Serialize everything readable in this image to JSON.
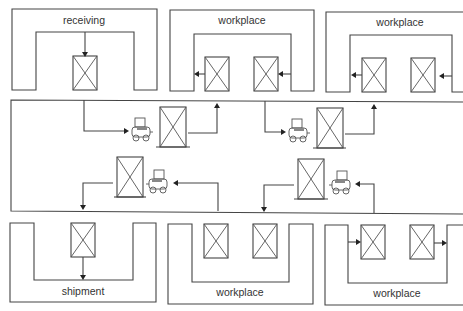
{
  "diagram": {
    "type": "warehouse material-flow layout",
    "zones": {
      "top": [
        {
          "id": "receiving",
          "label": "receiving",
          "pallets": 1
        },
        {
          "id": "workplace-top-1",
          "label": "workplace",
          "pallets": 2
        },
        {
          "id": "workplace-top-2",
          "label": "workplace",
          "pallets": 2
        }
      ],
      "bottom": [
        {
          "id": "shipment",
          "label": "shipment",
          "pallets": 1
        },
        {
          "id": "workplace-bottom-1",
          "label": "workplace",
          "pallets": 2
        },
        {
          "id": "workplace-bottom-2",
          "label": "workplace",
          "pallets": 2
        }
      ]
    },
    "aisle": {
      "forklifts": [
        {
          "id": "forklift-1",
          "row": "upper",
          "direction": "right",
          "carrying": "pallet"
        },
        {
          "id": "forklift-2",
          "row": "upper",
          "direction": "right",
          "carrying": "pallet"
        },
        {
          "id": "forklift-3",
          "row": "lower",
          "direction": "left",
          "carrying": "pallet"
        },
        {
          "id": "forklift-4",
          "row": "lower",
          "direction": "left",
          "carrying": "pallet"
        }
      ]
    },
    "colors": {
      "line": "#444444",
      "forklift_seat": "#888888",
      "background": "#ffffff"
    }
  }
}
